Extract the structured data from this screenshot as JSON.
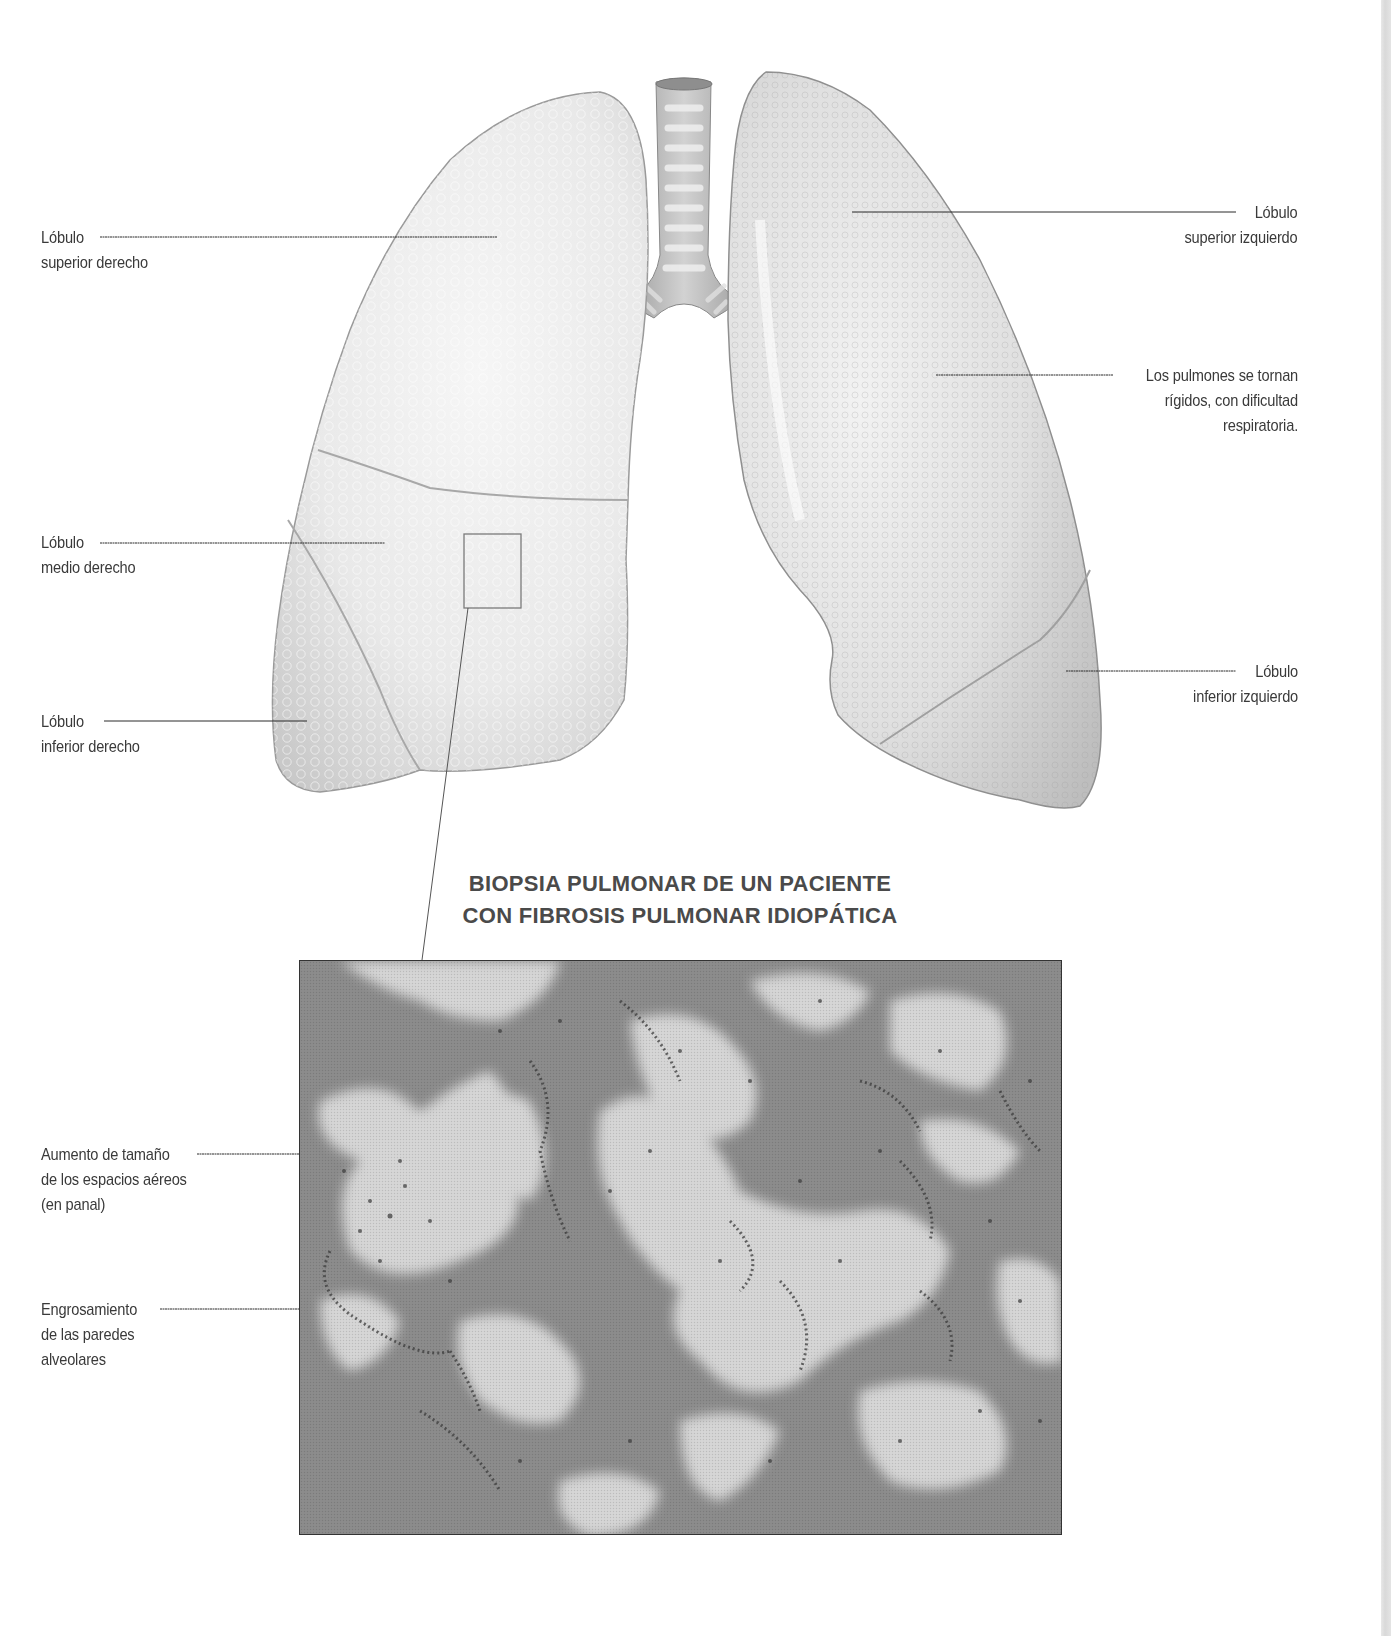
{
  "figure": {
    "lung_labels": {
      "right_upper": {
        "line1": "Lóbulo",
        "line2": "superior derecho"
      },
      "right_middle": {
        "line1": "Lóbulo",
        "line2": "medio derecho"
      },
      "right_lower": {
        "line1": "Lóbulo",
        "line2": "inferior derecho"
      },
      "left_upper": {
        "line1": "Lóbulo",
        "line2": "superior izquierdo"
      },
      "left_lower": {
        "line1": "Lóbulo",
        "line2": "inferior izquierdo"
      },
      "stiffness_note": {
        "line1": "Los pulmones se tornan",
        "line2": "rígidos, con dificultad",
        "line3": "respiratoria."
      }
    },
    "biopsy": {
      "title_line1": "BIOPSIA PULMONAR DE UN PACIENTE",
      "title_line2": "CON FIBROSIS PULMONAR IDIOPÁTICA",
      "labels": {
        "honeycomb": {
          "line1": "Aumento de tamaño",
          "line2": "de los espacios aéreos",
          "line3": "(en panal)"
        },
        "wall_thickening": {
          "line1": "Engrosamiento",
          "line2": "de las paredes",
          "line3": "alveolares"
        }
      }
    },
    "colors": {
      "lung_fill": "#ececec",
      "lung_shade": "#cfcfcf",
      "trachea": "#b9b9b9",
      "tissue_dark": "#8a8a8a",
      "tissue_light": "#d8d8d8",
      "leader_line": "#222222",
      "label_text": "#3a3a3a",
      "title_text": "#4a4a4a"
    }
  }
}
